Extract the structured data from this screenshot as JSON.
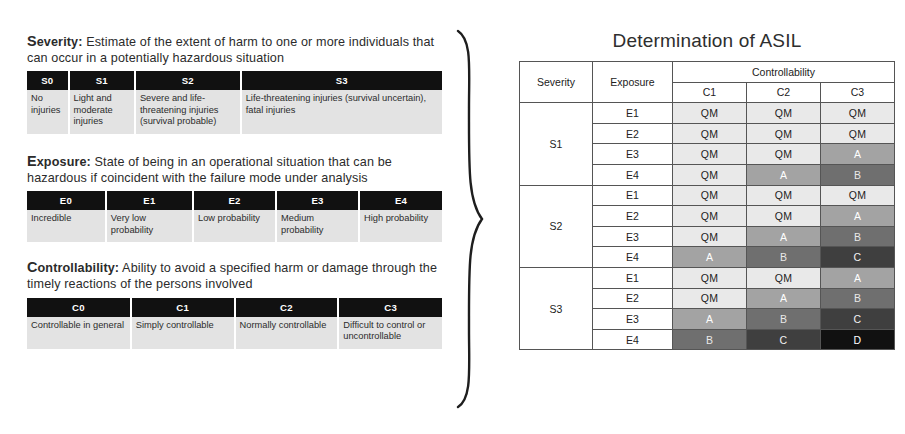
{
  "left_panel": {
    "sections": [
      {
        "id": "severity",
        "lead": "S",
        "rest": "everity:",
        "description": " Estimate of the extent of harm to one or more individuals that can occur in a potentially hazardous situation",
        "headers": [
          "S0",
          "S1",
          "S2",
          "S3"
        ],
        "cells": [
          "No injuries",
          "Light and moderate injuries",
          "Severe and life-threatening injuries (survival probable)",
          "Life-threatening injuries (survival uncertain), fatal injuries"
        ],
        "col_widths": [
          "10%",
          "16%",
          "25.5%",
          "48.5%"
        ]
      },
      {
        "id": "exposure",
        "lead": "E",
        "rest": "xposure:",
        "description": " State of being in an operational situation that can be hazardous if coincident with the failure mode under analysis",
        "headers": [
          "E0",
          "E1",
          "E2",
          "E3",
          "E4"
        ],
        "cells": [
          "Incredible",
          "Very low probability",
          "Low probability",
          "Medium probability",
          "High probability"
        ],
        "col_widths": [
          "19%",
          "21%",
          "20%",
          "20%",
          "20%"
        ]
      },
      {
        "id": "controllability",
        "lead": "C",
        "rest": "ontrollability:",
        "description": " Ability to avoid a specified harm or damage through the timely reactions of the persons involved",
        "headers": [
          "C0",
          "C1",
          "C2",
          "C3"
        ],
        "cells": [
          "Controllable in general",
          "Simply controllable",
          "Normally controllable",
          "Difficult to control or uncontrollable"
        ],
        "col_widths": [
          "25%",
          "25%",
          "25%",
          "25%"
        ]
      }
    ]
  },
  "right_panel": {
    "title": "Determination of ASIL",
    "headers": {
      "severity": "Severity",
      "exposure": "Exposure",
      "controllability": "Controllability",
      "c_levels": [
        "C1",
        "C2",
        "C3"
      ]
    }
  },
  "chart_data": {
    "type": "table",
    "title": "Determination of ASIL",
    "row_group_label": "Severity",
    "row_label": "Exposure",
    "col_group_label": "Controllability",
    "columns": [
      "C1",
      "C2",
      "C3"
    ],
    "severity_levels": [
      "S1",
      "S2",
      "S3"
    ],
    "exposure_levels": [
      "E1",
      "E2",
      "E3",
      "E4"
    ],
    "legend_levels": [
      "QM",
      "A",
      "B",
      "C",
      "D"
    ],
    "level_colors": {
      "QM": "#e9e9e9",
      "A": "#a3a3a3",
      "B": "#6f6f6f",
      "C": "#3f3f3f",
      "D": "#111111"
    },
    "groups": [
      {
        "severity": "S1",
        "rows": [
          {
            "exposure": "E1",
            "values": [
              "QM",
              "QM",
              "QM"
            ]
          },
          {
            "exposure": "E2",
            "values": [
              "QM",
              "QM",
              "QM"
            ]
          },
          {
            "exposure": "E3",
            "values": [
              "QM",
              "QM",
              "A"
            ]
          },
          {
            "exposure": "E4",
            "values": [
              "QM",
              "A",
              "B"
            ]
          }
        ]
      },
      {
        "severity": "S2",
        "rows": [
          {
            "exposure": "E1",
            "values": [
              "QM",
              "QM",
              "QM"
            ]
          },
          {
            "exposure": "E2",
            "values": [
              "QM",
              "QM",
              "A"
            ]
          },
          {
            "exposure": "E3",
            "values": [
              "QM",
              "A",
              "B"
            ]
          },
          {
            "exposure": "E4",
            "values": [
              "A",
              "B",
              "C"
            ]
          }
        ]
      },
      {
        "severity": "S3",
        "rows": [
          {
            "exposure": "E1",
            "values": [
              "QM",
              "QM",
              "A"
            ]
          },
          {
            "exposure": "E2",
            "values": [
              "QM",
              "A",
              "B"
            ]
          },
          {
            "exposure": "E3",
            "values": [
              "A",
              "B",
              "C"
            ]
          },
          {
            "exposure": "E4",
            "values": [
              "B",
              "C",
              "D"
            ]
          }
        ]
      }
    ]
  }
}
